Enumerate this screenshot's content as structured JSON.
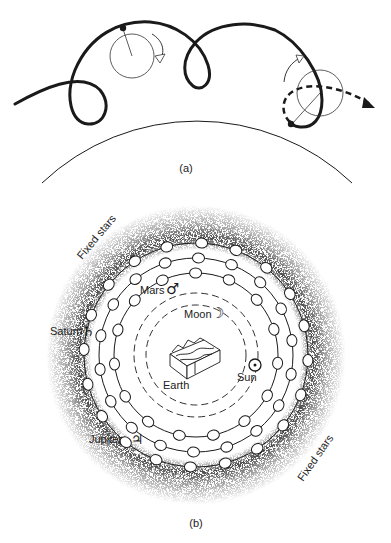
{
  "panel_a": {
    "caption": "(a)",
    "description": "Epicycle on deferent producing retrograde loops"
  },
  "panel_b": {
    "caption": "(b)",
    "center_label": "Earth",
    "bodies": [
      {
        "name": "Moon",
        "symbol": "☽"
      },
      {
        "name": "Sun",
        "symbol": "☉"
      },
      {
        "name": "Mars",
        "symbol": "♂"
      },
      {
        "name": "Jupiter",
        "symbol": "♃"
      },
      {
        "name": "Saturn",
        "symbol": "♄"
      }
    ],
    "outer_label_1": "Fixed stars",
    "outer_label_2": "Fixed stars"
  },
  "colors": {
    "ink": "#1a1a1a",
    "background": "#ffffff",
    "stipple": "#555555"
  }
}
